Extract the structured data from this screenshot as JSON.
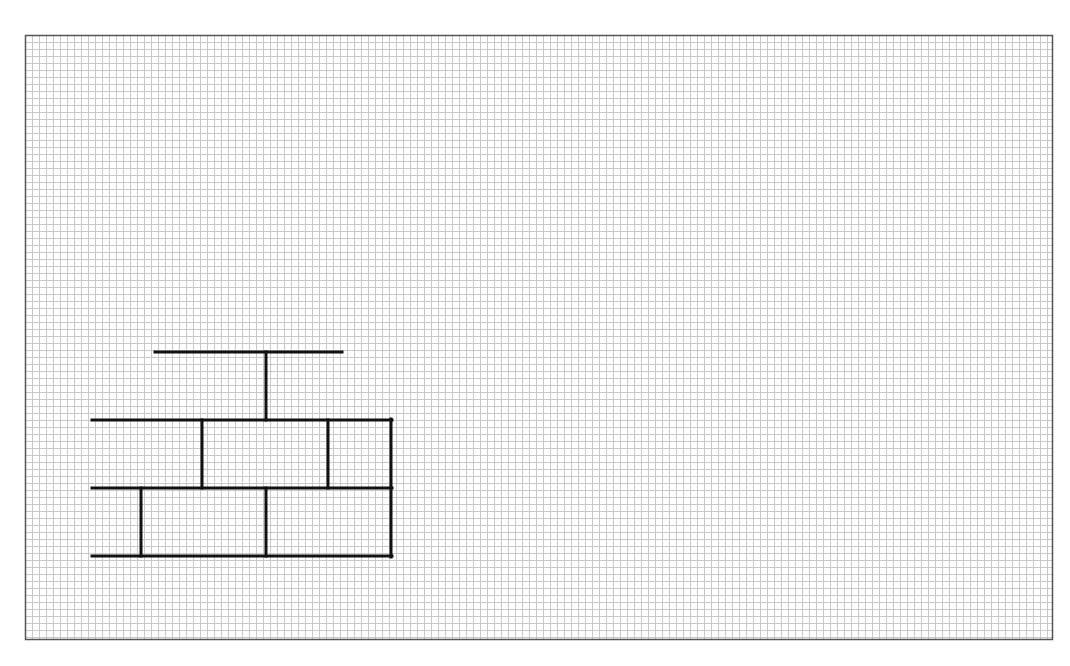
{
  "title": "Brick wall drawing on graph paper",
  "paper": {
    "frame": {
      "x": 25,
      "y": 35,
      "width": 1027,
      "height": 604
    },
    "grid_pitch": 7,
    "grid_color": "#c8c8c8",
    "frame_color": "#555555",
    "background": "#ffffff"
  },
  "drawing": {
    "stroke_color": "#111111",
    "stroke_width": 3,
    "lines": [
      {
        "name": "top-cap-horizontal",
        "x1": 155,
        "y1": 352,
        "x2": 342,
        "y2": 352
      },
      {
        "name": "top-cap-stem",
        "x1": 266,
        "y1": 352,
        "x2": 266,
        "y2": 420
      },
      {
        "name": "row-line-1",
        "x1": 92,
        "y1": 420,
        "x2": 392,
        "y2": 420
      },
      {
        "name": "row-line-2",
        "x1": 92,
        "y1": 488,
        "x2": 392,
        "y2": 488
      },
      {
        "name": "row-line-3",
        "x1": 92,
        "y1": 556,
        "x2": 392,
        "y2": 556
      },
      {
        "name": "right-edge",
        "x1": 391,
        "y1": 419,
        "x2": 391,
        "y2": 557
      },
      {
        "name": "upper-row-joint-1",
        "x1": 202,
        "y1": 420,
        "x2": 202,
        "y2": 488
      },
      {
        "name": "upper-row-joint-2",
        "x1": 328,
        "y1": 420,
        "x2": 328,
        "y2": 488
      },
      {
        "name": "lower-row-joint-1",
        "x1": 141,
        "y1": 488,
        "x2": 141,
        "y2": 556
      },
      {
        "name": "lower-row-joint-2",
        "x1": 266,
        "y1": 488,
        "x2": 266,
        "y2": 556
      }
    ]
  }
}
